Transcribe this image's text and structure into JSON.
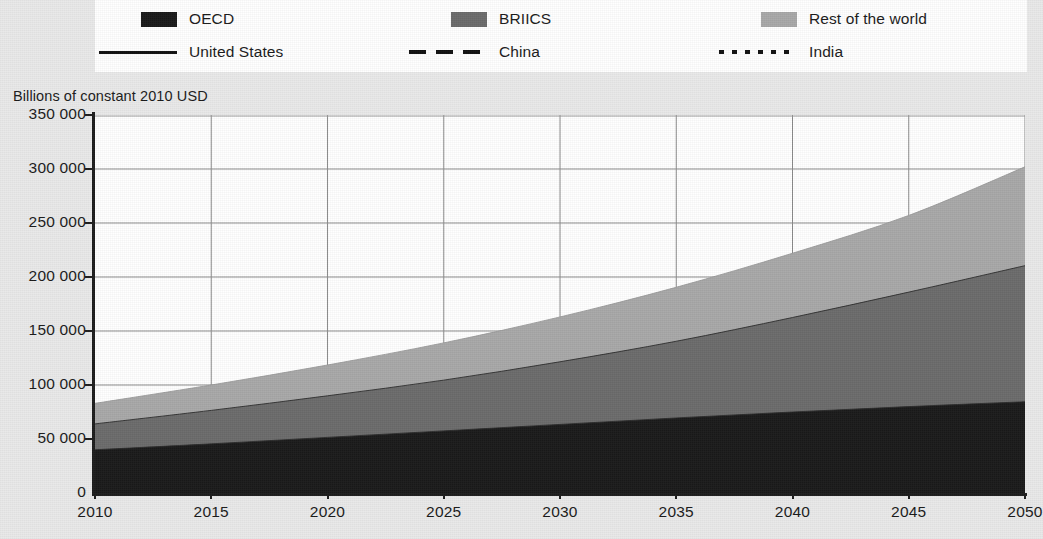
{
  "legend": {
    "areas": [
      {
        "label": "OECD",
        "icon": "legend-swatch-black",
        "color": "#1a1a1a"
      },
      {
        "label": "BRIICS",
        "icon": "legend-swatch-dark-gray",
        "color": "#6b6b6b"
      },
      {
        "label": "Rest of the world",
        "icon": "legend-swatch-light-gray",
        "color": "#a8a8a8"
      }
    ],
    "lines": [
      {
        "label": "United States",
        "icon": "legend-line-solid",
        "style": "solid"
      },
      {
        "label": "China",
        "icon": "legend-line-dashed",
        "style": "dashed"
      },
      {
        "label": "India",
        "icon": "legend-line-dotted",
        "style": "dotted"
      }
    ]
  },
  "chart_data": {
    "type": "area",
    "title": "",
    "subtitle": "",
    "ylabel": "Billions of constant 2010 USD",
    "xlabel": "",
    "ylim": [
      0,
      350000
    ],
    "xlim": [
      2010,
      2050
    ],
    "grid": true,
    "legend_position": "top",
    "ytick_labels": [
      "350 000",
      "300 000",
      "250 000",
      "200 000",
      "150 000",
      "100 000",
      "50 000",
      "0"
    ],
    "ytick_values": [
      350000,
      300000,
      250000,
      200000,
      150000,
      100000,
      50000,
      0
    ],
    "xtick_labels": [
      "2010",
      "2015",
      "2020",
      "2025",
      "2030",
      "2035",
      "2040",
      "2045",
      "2050"
    ],
    "xtick_values": [
      2010,
      2015,
      2020,
      2025,
      2030,
      2035,
      2040,
      2045,
      2050
    ],
    "x": [
      2010,
      2015,
      2020,
      2025,
      2030,
      2035,
      2040,
      2045,
      2050
    ],
    "stacked": true,
    "series": [
      {
        "name": "OECD",
        "color": "#1a1a1a",
        "values": [
          40000,
          45500,
          51500,
          57500,
          63500,
          69500,
          75000,
          80000,
          84500
        ]
      },
      {
        "name": "BRIICS",
        "color": "#6b6b6b",
        "values": [
          24000,
          31000,
          38500,
          47000,
          58000,
          71000,
          87500,
          106000,
          126000
        ]
      },
      {
        "name": "Rest of the world",
        "color": "#a8a8a8",
        "values": [
          19000,
          23500,
          28500,
          34500,
          41500,
          50000,
          59500,
          71000,
          91500
        ]
      }
    ],
    "stack_totals": [
      83000,
      100000,
      118500,
      139000,
      163000,
      190500,
      222000,
      257000,
      302000
    ],
    "overlay_lines": [
      {
        "name": "United States",
        "style": "solid"
      },
      {
        "name": "China",
        "style": "dashed"
      },
      {
        "name": "India",
        "style": "dotted"
      }
    ]
  }
}
